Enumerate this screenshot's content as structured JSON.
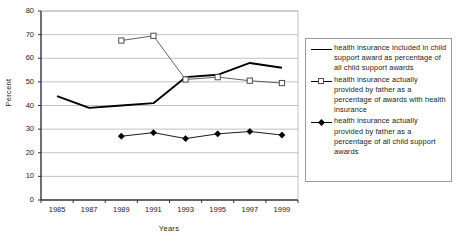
{
  "chart_data": {
    "type": "line",
    "title": "",
    "xlabel": "Years",
    "ylabel": "Percent",
    "categories": [
      "1985",
      "1987",
      "1989",
      "1991",
      "1993",
      "1995",
      "1997",
      "1999"
    ],
    "x": [
      1985,
      1987,
      1989,
      1991,
      1993,
      1995,
      1997,
      1999
    ],
    "ylim": [
      0,
      80
    ],
    "ytick_labels": [
      "0",
      "10",
      "20",
      "30",
      "40",
      "50",
      "60",
      "70",
      "80"
    ],
    "ytick_values": [
      0,
      10,
      20,
      30,
      40,
      50,
      60,
      70,
      80
    ],
    "grid": "horizontal",
    "legend_position": "right-outside",
    "series": [
      {
        "name": "health insurance included in child support award as percentage of all child support awards",
        "marker": "none",
        "line_style": "thick-solid",
        "color": "#000000",
        "values": [
          44,
          39,
          40,
          41,
          52,
          53,
          58,
          56
        ]
      },
      {
        "name": "health insurance actually provided by father as a percentage of awards with health insurance",
        "marker": "open-square",
        "line_style": "thin-solid",
        "color": "#4d4d4d",
        "values": [
          null,
          null,
          67.5,
          69.5,
          51,
          52,
          50.5,
          49.5
        ]
      },
      {
        "name": "health insurance actually provided by father as a percentage of all child support awards",
        "marker": "filled-diamond",
        "line_style": "thin-solid",
        "color": "#000000",
        "values": [
          null,
          null,
          27,
          28.5,
          26,
          28,
          29,
          27.5
        ]
      }
    ]
  },
  "legend": {
    "entries": [
      {
        "marker_name": "thick-line-swatch",
        "label": "health insurance included in child support award as percentage of all child support awards"
      },
      {
        "marker_name": "open-square-swatch",
        "label": "health insurance actually provided by father as a percentage of awards with health insurance"
      },
      {
        "marker_name": "filled-diamond-swatch",
        "label": "health insurance actually provided by father as a percentage of all child support awards"
      }
    ]
  },
  "colors": {
    "axis": "#333333",
    "grid": "#b3b3b3",
    "series_1": "#000000",
    "series_2": "#4d4d4d",
    "series_3": "#000000",
    "background": "#ffffff"
  }
}
